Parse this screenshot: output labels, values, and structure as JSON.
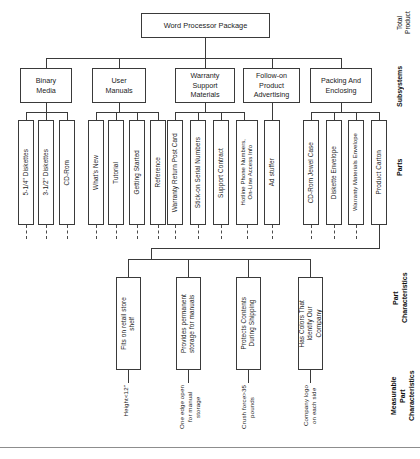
{
  "diagram": {
    "title": "Word Processor Package",
    "root": {
      "label": "Word Processor Package"
    },
    "row_labels": [
      {
        "id": "total-product",
        "label": "Total\nProduct"
      },
      {
        "id": "subsystems",
        "label": "Subsystems"
      },
      {
        "id": "parts",
        "label": "Parts"
      },
      {
        "id": "part-characteristics",
        "label": "Part\nCharacteristics"
      },
      {
        "id": "measurable-part-characteristics",
        "label": "Measurable\nPart\nCharacteristics"
      }
    ],
    "subsystems": [
      {
        "label": "Binary\nMedia"
      },
      {
        "label": "User\nManuals"
      },
      {
        "label": "Warranty\nSupport\nMaterials"
      },
      {
        "label": "Follow-on\nProduct\nAdvertising"
      },
      {
        "label": "Packing And\nEnclosing"
      }
    ],
    "parts": [
      {
        "label": "5-1/4\" Diskettes"
      },
      {
        "label": "3-1/2\" Diskettes"
      },
      {
        "label": "CD-Rom"
      },
      {
        "label": "What's New"
      },
      {
        "label": "Tutorial"
      },
      {
        "label": "Getting Started"
      },
      {
        "label": "Reference"
      },
      {
        "label": "Warranty Return Post Card"
      },
      {
        "label": "Stick-on Serial Numbers"
      },
      {
        "label": "Support Contract"
      },
      {
        "label": "Hotline Phone Numbers,\nOn-Line Access Info"
      },
      {
        "label": "Ad stuffer"
      },
      {
        "label": "CD-Rom Jewel Case"
      },
      {
        "label": "Diskette Envelope"
      },
      {
        "label": "Warranty Materials Envelope"
      },
      {
        "label": "Product Carton"
      }
    ],
    "part_characteristics": [
      {
        "label": "Fits on retail store\nshelf"
      },
      {
        "label": "Provides permanent\nstorage for manuals"
      },
      {
        "label": "Protects Contents\nDuring Shipping"
      },
      {
        "label": "Has Colors That\nIdentify Our\nCompany"
      }
    ],
    "measurable_characteristics": [
      {
        "label": "Height<12\""
      },
      {
        "label": "One edge open\nfor manual\nstorage"
      },
      {
        "label": "Crush force>35\npounds"
      },
      {
        "label": "Company logo\non each side"
      }
    ],
    "colors": {
      "line": "#3a3a3a",
      "text": "#1b1b1b",
      "background": "#ffffff"
    }
  }
}
